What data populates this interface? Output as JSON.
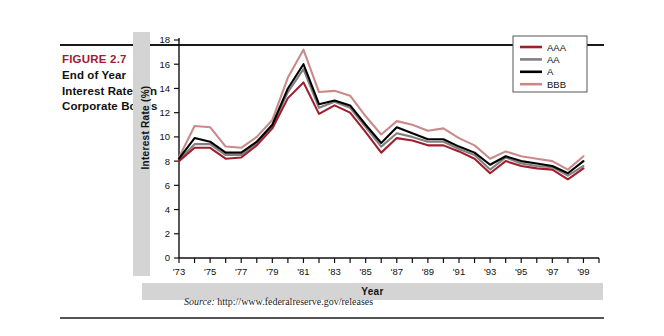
{
  "figure": {
    "number": "FIGURE 2.7",
    "title_lines": [
      "End of Year",
      "Interest Rates on",
      "Corporate Bonds"
    ],
    "title_line1": "End of Year",
    "title_line2": "Interest Rates on",
    "title_line3": "Corporate Bonds",
    "source_prefix": "Source:",
    "source_url": "http://www.federalreserve.gov/releases",
    "accent_color": "#9e1b32"
  },
  "chart_data": {
    "type": "line",
    "title": "",
    "xlabel": "Year",
    "ylabel": "Interest Rate (%)",
    "xlim": [
      1973,
      2000
    ],
    "ylim": [
      0,
      18
    ],
    "ytick_step": 2,
    "yticks": [
      0,
      2,
      4,
      6,
      8,
      10,
      12,
      14,
      16,
      18
    ],
    "ytick_labels": [
      "0",
      "2",
      "4",
      "6",
      "8",
      "10",
      "12",
      "14",
      "16",
      "18"
    ],
    "xticks": [
      1973,
      1974,
      1975,
      1976,
      1977,
      1978,
      1979,
      1980,
      1981,
      1982,
      1983,
      1984,
      1985,
      1986,
      1987,
      1988,
      1989,
      1990,
      1991,
      1992,
      1993,
      1994,
      1995,
      1996,
      1997,
      1998,
      1999,
      2000
    ],
    "xtick_labels": [
      "'73",
      "",
      "'75",
      "",
      "'77",
      "",
      "'79",
      "",
      "'81",
      "",
      "'83",
      "",
      "'85",
      "",
      "'87",
      "",
      "'89",
      "",
      "'91",
      "",
      "'93",
      "",
      "'95",
      "",
      "'97",
      "",
      "'99",
      ""
    ],
    "grid": false,
    "legend_position": "top-right",
    "x": [
      1973,
      1974,
      1975,
      1976,
      1977,
      1978,
      1979,
      1980,
      1981,
      1982,
      1983,
      1984,
      1985,
      1986,
      1987,
      1988,
      1989,
      1990,
      1991,
      1992,
      1993,
      1994,
      1995,
      1996,
      1997,
      1998,
      1999
    ],
    "series": [
      {
        "name": "AAA",
        "color": "#a01f2e",
        "values": [
          8.0,
          9.1,
          9.1,
          8.2,
          8.3,
          9.3,
          10.7,
          13.2,
          14.5,
          11.9,
          12.6,
          12.0,
          10.4,
          8.7,
          9.9,
          9.7,
          9.3,
          9.3,
          8.8,
          8.2,
          7.0,
          8.0,
          7.6,
          7.4,
          7.3,
          6.5,
          7.4
        ]
      },
      {
        "name": "AA",
        "color": "#808080",
        "values": [
          8.1,
          9.4,
          9.4,
          8.5,
          8.5,
          9.5,
          10.9,
          13.7,
          15.6,
          12.4,
          12.9,
          12.4,
          10.8,
          9.2,
          10.3,
          10.0,
          9.6,
          9.6,
          9.0,
          8.5,
          7.3,
          8.3,
          7.8,
          7.6,
          7.5,
          6.8,
          7.6
        ]
      },
      {
        "name": "A",
        "color": "#000000",
        "values": [
          8.2,
          9.9,
          9.6,
          8.7,
          8.7,
          9.6,
          11.0,
          14.0,
          16.0,
          12.7,
          13.0,
          12.6,
          11.0,
          9.5,
          10.8,
          10.3,
          9.8,
          9.8,
          9.2,
          8.7,
          7.7,
          8.4,
          8.0,
          7.8,
          7.6,
          7.0,
          8.0
        ]
      },
      {
        "name": "BBB",
        "color": "#c98a8a",
        "values": [
          8.3,
          10.9,
          10.8,
          9.2,
          9.1,
          10.0,
          11.4,
          14.9,
          17.2,
          13.7,
          13.8,
          13.4,
          11.7,
          10.2,
          11.3,
          11.0,
          10.5,
          10.7,
          9.9,
          9.3,
          8.2,
          8.8,
          8.4,
          8.2,
          8.0,
          7.3,
          8.4
        ]
      }
    ],
    "legend": [
      "AAA",
      "AA",
      "A",
      "BBB"
    ]
  }
}
